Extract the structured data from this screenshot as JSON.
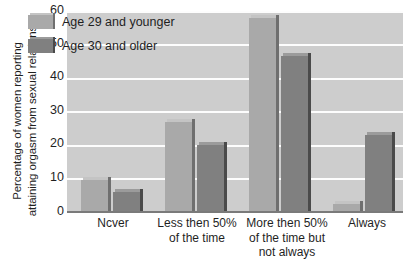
{
  "chart_data": {
    "type": "bar",
    "title": "",
    "xlabel": "",
    "ylabel": "Percentage of women reporting attaining orgasm from sexual relations",
    "ylabel_lines": [
      "Percentage of women reporting",
      "attaining orgasm from sexual relations"
    ],
    "categories": [
      "Ncver",
      "Less then 50% of the time",
      "More then 50% of the time but not always",
      "Always"
    ],
    "category_lines": [
      [
        "Ncver"
      ],
      [
        "Less then 50%",
        "of the time"
      ],
      [
        "More then 50%",
        "of the time but",
        "not always"
      ],
      [
        "Always"
      ]
    ],
    "series": [
      {
        "name": "Age 29 and younger",
        "values": [
          9.5,
          27,
          58,
          2.5
        ],
        "color": "#a9a9a9"
      },
      {
        "name": "Age 30 and older",
        "values": [
          6,
          20,
          46.5,
          23
        ],
        "color": "#808080"
      }
    ],
    "ylim": [
      0,
      60
    ],
    "yticks": [
      0,
      10,
      20,
      30,
      40,
      50,
      60
    ],
    "ytick_labels": [
      "0",
      "10",
      "20",
      "30",
      "40",
      "50",
      "60"
    ],
    "grid": true,
    "grid_color": "#fdfdfd",
    "plot_background": "#cdcdcd",
    "legend_position": "top-left",
    "legend": [
      {
        "label": "Age 29 and younger",
        "swatch": "light"
      },
      {
        "label": "Age 30 and older",
        "swatch": "dark"
      }
    ]
  }
}
